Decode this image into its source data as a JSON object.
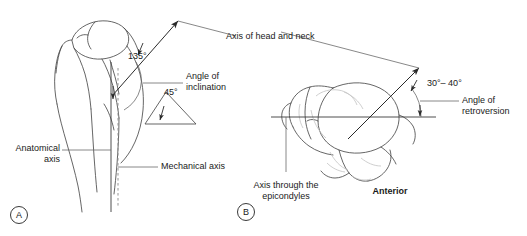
{
  "figure": {
    "background_color": "#ffffff",
    "ink_color": "#3a3a3a",
    "text_color": "#1a1a1a",
    "faint_color": "#b9b9b9"
  },
  "panels": [
    {
      "id": "A",
      "marker": "A",
      "view": "anterior coronal view of proximal humerus"
    },
    {
      "id": "B",
      "marker": "B",
      "view": "axial view of proximal humerus"
    }
  ],
  "panel_a": {
    "marker": "A",
    "angles": {
      "inclination_value": "135°",
      "secondary_value": "45°"
    },
    "labels": {
      "axis_head_neck": "Axis of head and neck",
      "angle_of_inclination_line1": "Angle of",
      "angle_of_inclination_line2": "inclination",
      "anatomical_axis_line1": "Anatomical",
      "anatomical_axis_line2": "axis",
      "mechanical_axis": "Mechanical axis"
    }
  },
  "panel_b": {
    "marker": "B",
    "angles": {
      "retroversion_range": "30°– 40°"
    },
    "labels": {
      "angle_of_retroversion_line1": "Angle of",
      "angle_of_retroversion_line2": "retroversion",
      "axis_through_epicondyles_line1": "Axis through the",
      "axis_through_epicondyles_line2": "epicondyles",
      "anterior": "Anterior"
    }
  }
}
